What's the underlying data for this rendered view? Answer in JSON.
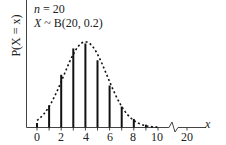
{
  "chart_data": {
    "type": "bar",
    "subtype": "stem-plot with dashed smooth envelope",
    "title": "",
    "annotations": [
      "n = 20",
      "X ~ B(20, 0.2)"
    ],
    "xlabel": "x",
    "ylabel": "P(X = x)",
    "x_ticks": [
      "0",
      "2",
      "4",
      "6",
      "8",
      "10",
      "20"
    ],
    "x_axis_break": "between 10 and 20",
    "categories": [
      0,
      1,
      2,
      3,
      4,
      5,
      6,
      7,
      8,
      9,
      10
    ],
    "values": [
      0.0115,
      0.0576,
      0.1369,
      0.2054,
      0.2182,
      0.1746,
      0.1091,
      0.0545,
      0.0222,
      0.0074,
      0.002
    ],
    "ylim": [
      0,
      0.33
    ],
    "grid": false,
    "legend": "none",
    "colors": {
      "bars": "#111111",
      "curve": "#111111",
      "axes": "#444444"
    }
  },
  "labels": {
    "n_text_var": "n",
    "n_text_rest": " = 20",
    "dist_var": "X",
    "dist_rest": " ~ B(20, 0.2)",
    "y_axis": "P(X = x)",
    "x_axis": "x",
    "ticks": {
      "t0": "0",
      "t2": "2",
      "t4": "4",
      "t6": "6",
      "t8": "8",
      "t10": "10",
      "t20": "20"
    }
  }
}
